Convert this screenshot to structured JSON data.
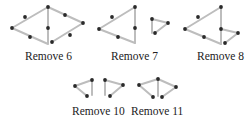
{
  "figures": [
    {
      "id": "remove-6",
      "label": "Remove 6",
      "label_pos": [
        25,
        50
      ],
      "sticks": [
        [
          [
            12,
            28
          ],
          [
            48,
            7
          ]
        ],
        [
          [
            12,
            28
          ],
          [
            48,
            44
          ]
        ],
        [
          [
            48,
            7
          ],
          [
            48,
            43
          ]
        ],
        [
          [
            48,
            7
          ],
          [
            83,
            23
          ]
        ],
        [
          [
            83,
            23
          ],
          [
            52,
            42
          ]
        ]
      ],
      "heads": [
        [
          25,
          17
        ],
        [
          30,
          37
        ],
        [
          48,
          7
        ],
        [
          48,
          28
        ],
        [
          65,
          15
        ],
        [
          83,
          23
        ],
        [
          70,
          35
        ],
        [
          52,
          42
        ],
        [
          12,
          28
        ]
      ]
    },
    {
      "id": "remove-7",
      "label": "Remove 7",
      "label_pos": [
        111,
        50
      ],
      "sticks": [
        [
          [
            99,
            29
          ],
          [
            135,
            7
          ]
        ],
        [
          [
            99,
            29
          ],
          [
            135,
            43
          ]
        ],
        [
          [
            135,
            7
          ],
          [
            135,
            43
          ]
        ],
        [
          [
            152,
            19
          ],
          [
            152,
            33
          ]
        ],
        [
          [
            152,
            19
          ],
          [
            168,
            23
          ]
        ],
        [
          [
            168,
            23
          ],
          [
            155,
            33
          ]
        ]
      ],
      "heads": [
        [
          112,
          17
        ],
        [
          99,
          29
        ],
        [
          118,
          37
        ],
        [
          135,
          7
        ],
        [
          135,
          28
        ],
        [
          152,
          19
        ],
        [
          168,
          23
        ],
        [
          155,
          33
        ]
      ]
    },
    {
      "id": "remove-8",
      "label": "Remove 8",
      "label_pos": [
        197,
        50
      ],
      "sticks": [
        [
          [
            185,
            29
          ],
          [
            221,
            7
          ]
        ],
        [
          [
            185,
            29
          ],
          [
            221,
            44
          ]
        ],
        [
          [
            221,
            7
          ],
          [
            221,
            44
          ]
        ],
        [
          [
            221,
            29
          ],
          [
            238,
            33
          ]
        ],
        [
          [
            238,
            33
          ],
          [
            225,
            43
          ]
        ]
      ],
      "heads": [
        [
          198,
          17
        ],
        [
          185,
          29
        ],
        [
          204,
          37
        ],
        [
          221,
          7
        ],
        [
          221,
          29
        ],
        [
          238,
          33
        ],
        [
          225,
          43
        ]
      ]
    },
    {
      "id": "remove-10",
      "label": "Remove 10",
      "label_pos": [
        72,
        105
      ],
      "sticks": [
        [
          [
            75,
            86
          ],
          [
            92,
            80
          ]
        ],
        [
          [
            75,
            86
          ],
          [
            87,
            96
          ]
        ],
        [
          [
            92,
            80
          ],
          [
            92,
            95
          ]
        ],
        [
          [
            105,
            80
          ],
          [
            105,
            95
          ]
        ],
        [
          [
            105,
            80
          ],
          [
            123,
            85
          ]
        ],
        [
          [
            123,
            85
          ],
          [
            110,
            96
          ]
        ]
      ],
      "heads": [
        [
          75,
          86
        ],
        [
          92,
          80
        ],
        [
          87,
          96
        ],
        [
          105,
          80
        ],
        [
          123,
          85
        ],
        [
          110,
          96
        ]
      ]
    },
    {
      "id": "remove-11",
      "label": "Remove 11",
      "label_pos": [
        131,
        105
      ],
      "sticks": [
        [
          [
            139,
            85
          ],
          [
            158,
            79
          ]
        ],
        [
          [
            139,
            85
          ],
          [
            153,
            97
          ]
        ],
        [
          [
            158,
            79
          ],
          [
            158,
            96
          ]
        ],
        [
          [
            158,
            79
          ],
          [
            176,
            87
          ]
        ],
        [
          [
            176,
            87
          ],
          [
            162,
            97
          ]
        ]
      ],
      "heads": [
        [
          139,
          85
        ],
        [
          158,
          79
        ],
        [
          153,
          97
        ],
        [
          176,
          87
        ],
        [
          162,
          97
        ]
      ]
    }
  ],
  "colors": {
    "stick": "#bdbdbd",
    "head": "#2a2a2a",
    "text": "#222222"
  }
}
